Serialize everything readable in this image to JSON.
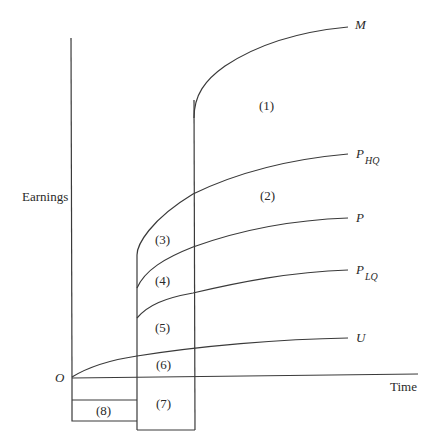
{
  "diagram": {
    "axes": {
      "y_label": "Earnings",
      "x_label": "Time",
      "origin_label": "O"
    },
    "curves": [
      {
        "id": "M",
        "label": "M",
        "subscript": ""
      },
      {
        "id": "P_HQ",
        "label": "P",
        "subscript": "HQ"
      },
      {
        "id": "P",
        "label": "P",
        "subscript": ""
      },
      {
        "id": "P_LQ",
        "label": "P",
        "subscript": "LQ"
      },
      {
        "id": "U",
        "label": "U",
        "subscript": ""
      }
    ],
    "regions": [
      {
        "id": "1",
        "label": "(1)"
      },
      {
        "id": "2",
        "label": "(2)"
      },
      {
        "id": "3",
        "label": "(3)"
      },
      {
        "id": "4",
        "label": "(4)"
      },
      {
        "id": "5",
        "label": "(5)"
      },
      {
        "id": "6",
        "label": "(6)"
      },
      {
        "id": "7",
        "label": "(7)"
      },
      {
        "id": "8",
        "label": "(8)"
      }
    ],
    "colors": {
      "stroke": "#3a3a3a",
      "text": "#2a2a2a",
      "background": "#ffffff"
    }
  }
}
